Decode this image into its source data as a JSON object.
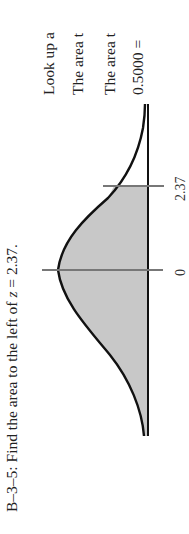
{
  "problem": {
    "id": "B–3–5:",
    "prompt_prefix": "Find the area to the left of ",
    "prompt_var": "z",
    "prompt_suffix": " = 2.37."
  },
  "solution_lines": [
    "Look up a",
    "The area t",
    "The area t",
    "0.5000 ="
  ],
  "figure": {
    "type": "normal-curve",
    "shaded_region": "left of z = 2.37",
    "ticks": [
      {
        "value": "0"
      },
      {
        "value": "2.37"
      }
    ],
    "colors": {
      "curve": "#111111",
      "shade": "#c8c8c8",
      "tick": "#777777",
      "axis": "#111111"
    }
  }
}
